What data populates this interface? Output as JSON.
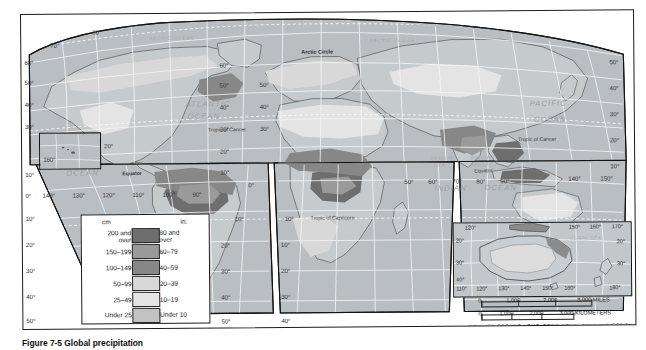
{
  "figure": {
    "caption": "Figure 7-5 Global precipitation",
    "projection_note": "MODIFIED GOODE'S HOMOLOSINE EQUAL-AREA PROJECTION"
  },
  "legend": {
    "name": "precipitation-legend",
    "header_left": "cm",
    "header_right": "in.",
    "rows": [
      {
        "cm": "200 and over",
        "cm_l1": "200 and",
        "cm_l2": "over",
        "in": "80 and over",
        "in_l1": "80 and",
        "in_l2": "over",
        "color": "#6e6e6e"
      },
      {
        "cm": "150–199",
        "cm_l1": "150–199",
        "cm_l2": "",
        "in": "60–79",
        "in_l1": "60–79",
        "in_l2": "",
        "color": "#9a9a9a"
      },
      {
        "cm": "100–149",
        "cm_l1": "100–149",
        "cm_l2": "",
        "in": "40–59",
        "in_l1": "40–59",
        "in_l2": "",
        "color": "#878787"
      },
      {
        "cm": "50–99",
        "cm_l1": "50–99",
        "cm_l2": "",
        "in": "20–39",
        "in_l1": "20–39",
        "in_l2": "",
        "color": "#d8d8d8"
      },
      {
        "cm": "25–49",
        "cm_l1": "25–49",
        "cm_l2": "",
        "in": "10–19",
        "in_l1": "10–19",
        "in_l2": "",
        "color": "#e4e4e4"
      },
      {
        "cm": "Under 25",
        "cm_l1": "Under 25",
        "cm_l2": "",
        "in": "Under 10",
        "in_l1": "Under 10",
        "in_l2": "",
        "color": "#c2c2c2"
      }
    ]
  },
  "ocean_labels": {
    "arctic_left": "ARCTIC OCEAN",
    "arctic_right": "ARCTIC OCEAN",
    "atlantic": "ATLANTIC",
    "atlantic2": "OCEAN",
    "pacific_left": "PACIFIC",
    "pacific_left2": "OCEAN",
    "pacific_right": "PACIFIC",
    "pacific_right2": "OCEAN",
    "indian": "INDIAN",
    "indian2": "OCEAN",
    "arabian_sea": "ARABIAN",
    "arabian_sea2": "SEA",
    "bay_of_bengal": "BAY OF",
    "bay_of_bengal2": "BENGAL",
    "coral_sea": "CORAL SEA"
  },
  "reference_lines": {
    "arctic_circle": "Arctic Circle",
    "equator_left": "Equator",
    "equator_right": "Equator",
    "tropic_cancer_left": "Tropic of Cancer",
    "tropic_cancer_right": "Tropic of Cancer",
    "tropic_capricorn": "Tropic of Capricorn"
  },
  "graticule": {
    "left_lat": [
      "70°",
      "60°",
      "50°",
      "40°",
      "30°",
      "20°",
      "10°",
      "0°",
      "10°",
      "20°",
      "30°",
      "40°",
      "50°"
    ],
    "pole_lat": "80°",
    "lat_west_lobe_col1": [
      "60°",
      "50°",
      "40°",
      "30°",
      "20°",
      "10°",
      "0°",
      "10°",
      "20°",
      "30°",
      "40°",
      "50°"
    ],
    "lat_east_lobe_col": [
      "50°",
      "40°",
      "30°",
      "20°",
      "10°",
      "0°",
      "10°",
      "20°",
      "30°",
      "40°",
      "50°"
    ],
    "right_lat": [
      "50°",
      "40°",
      "30°",
      "20°",
      "10°"
    ],
    "lon_pacific": [
      "140°",
      "130°",
      "120°",
      "110°",
      "100°",
      "90°"
    ],
    "lon_africa_asia": [
      "50°",
      "60°",
      "70°",
      "80°",
      "90°"
    ],
    "lon_far_east": [
      "140°",
      "150°"
    ],
    "hawaii_lon": "160°"
  },
  "oceania_inset": {
    "name": "oceania-inset",
    "lon_top": [
      "120°",
      "150°",
      "160°",
      "170°"
    ],
    "lon_bottom": [
      "110°",
      "120°",
      "130°",
      "140°",
      "150°",
      "160°",
      "180°"
    ],
    "lat_left": [
      "20°",
      "30°",
      "40°"
    ],
    "lat_right": [
      "20°",
      "30°"
    ],
    "sea_label": "CORAL SEA"
  },
  "scale": {
    "miles_ticks": [
      "0",
      "1,000",
      "2,000",
      "3,000 MILES"
    ],
    "km_ticks": [
      "0",
      "1,000",
      "2,000",
      "3,000 KILOMETERS"
    ],
    "miles_label": "MILES",
    "km_label": "KILOMETERS"
  },
  "colors": {
    "land_base": "#c6cacd",
    "ocean": "#b9bec2",
    "darkest": "#6e6e6e",
    "dark": "#878787",
    "mid": "#9a9a9a",
    "light": "#d8d8d8",
    "lightest": "#e4e4e4",
    "frame": "#1c1c1c"
  }
}
